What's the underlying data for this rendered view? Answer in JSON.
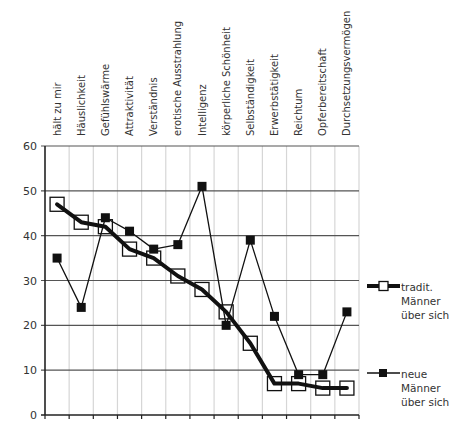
{
  "chart_data": {
    "type": "line",
    "title": "",
    "xlabel": "",
    "ylabel": "",
    "ylim": [
      0,
      60
    ],
    "yticks": [
      0,
      10,
      20,
      30,
      40,
      50,
      60
    ],
    "grid": true,
    "legend_position": "right",
    "categories": [
      "hält zu mir",
      "Häuslichkeit",
      "Gefühlswärme",
      "Attraktivität",
      "Verständnis",
      "erotische Ausstrahlung",
      "Intelligenz",
      "körperliche Schönheit",
      "Selbständigkeit",
      "Erwerbstätigkeit",
      "Reichtum",
      "Opferbereitschaft",
      "Durchsetzungsvermögen"
    ],
    "series": [
      {
        "name": "tradit. Männer über sich",
        "marker": "open-square",
        "line": "thick",
        "values": [
          47,
          43,
          42,
          37,
          35,
          31,
          28,
          23,
          16,
          7,
          7,
          6,
          6
        ]
      },
      {
        "name": "neue Männer über sich",
        "marker": "filled-square",
        "line": "thin",
        "values": [
          35,
          24,
          44,
          41,
          37,
          38,
          51,
          20,
          39,
          22,
          9,
          9,
          23
        ]
      }
    ]
  },
  "legend": {
    "items": [
      {
        "label": "tradit.\nMänner\nüber sich"
      },
      {
        "label": "neue\nMänner\nüber sich"
      }
    ]
  },
  "colors": {
    "line": "#111111",
    "major_grid": "#555555",
    "minor_grid": "#d6d6d6",
    "axis": "#222222"
  }
}
